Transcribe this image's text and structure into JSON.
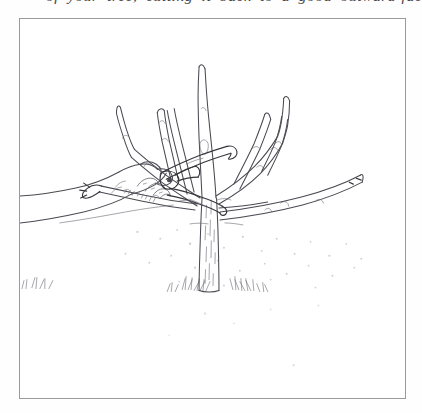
{
  "page": {
    "background_color": "#fefefe",
    "width": 422,
    "height": 413
  },
  "caption": {
    "text": "of your tree, cutting it back to a good outward-facing point.",
    "style": "italic-serif-clipped",
    "color": "#2b2b2b"
  },
  "figure": {
    "name": "pruning-illustration",
    "border_color": "#9a9a9a",
    "frame": {
      "x": 19,
      "y": 18,
      "width": 387,
      "height": 381
    },
    "ink_color": "#4a4a52",
    "subjects": [
      {
        "name": "tree-trunk",
        "label": "Tree trunk"
      },
      {
        "name": "scaffold-branches",
        "label": "Scaffold branches"
      },
      {
        "name": "upright-shoots",
        "label": "Upright shoots"
      },
      {
        "name": "hand",
        "label": "Hand"
      },
      {
        "name": "pruning-shears",
        "label": "Pruning shears"
      },
      {
        "name": "ground-line",
        "label": "Ground with grass tufts"
      }
    ]
  }
}
